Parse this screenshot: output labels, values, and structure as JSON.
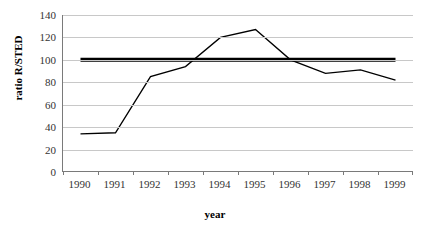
{
  "chart_data": {
    "type": "line",
    "title": "",
    "xlabel": "year",
    "ylabel": "ratio R/STED",
    "categories": [
      "1990",
      "1991",
      "1992",
      "1993",
      "1994",
      "1995",
      "1996",
      "1997",
      "1998",
      "1999"
    ],
    "series": [
      {
        "name": "ratio R/STED",
        "values": [
          34,
          35,
          85,
          94,
          120,
          127,
          100,
          88,
          91,
          82
        ],
        "color": "#000000",
        "style": "thin-line"
      },
      {
        "name": "reference-100",
        "values": [
          100,
          100,
          100,
          100,
          100,
          100,
          100,
          100,
          100,
          100
        ],
        "color": "#000000",
        "style": "thick-line"
      }
    ],
    "ylim": [
      0,
      140
    ],
    "ytick_labels": [
      "0",
      "20",
      "40",
      "60",
      "80",
      "100",
      "120",
      "140"
    ],
    "ytick_values": [
      0,
      20,
      40,
      60,
      80,
      100,
      120,
      140
    ],
    "grid": true,
    "legend": "none",
    "gridline_color": "#c8c8c8",
    "axis_color": "#7a7a7a"
  },
  "axes": {
    "y_title": "ratio R/STED",
    "x_title": "year"
  }
}
